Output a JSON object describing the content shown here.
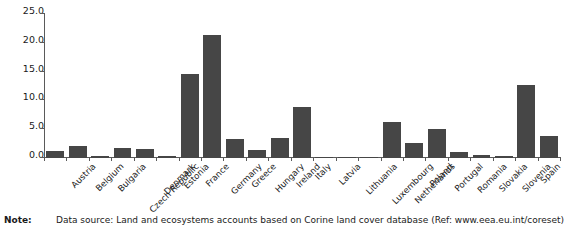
{
  "chart_data": {
    "type": "bar",
    "title": "",
    "subtitle": "",
    "xlabel": "",
    "ylabel": "",
    "ylim": [
      0.0,
      25.0
    ],
    "yticks": [
      "0.0",
      "5.0",
      "10.0",
      "15.0",
      "20.0",
      "25.0"
    ],
    "ytick_values": [
      0.0,
      5.0,
      10.0,
      15.0,
      20.0,
      25.0
    ],
    "grid": false,
    "legend": false,
    "legend_position": "none",
    "bar_color": "#464646",
    "axis_color": "#5a5a5a",
    "categories": [
      "Austria",
      "Belgium",
      "Bulgaria",
      "Czech Republic",
      "Denmark",
      "Estonia",
      "France",
      "Germany",
      "Greece",
      "Hungary",
      "Ireland",
      "Italy",
      "Latvia",
      "Lithuania",
      "Luxembourg",
      "Netherlands",
      "Poland",
      "Portugal",
      "Romania",
      "Slovakia",
      "Slovenia",
      "Spain",
      "United Kingdom"
    ],
    "values": [
      1.2,
      2.1,
      0.4,
      1.7,
      1.5,
      0.4,
      14.5,
      21.4,
      3.3,
      1.4,
      3.4,
      8.8,
      0.05,
      0.1,
      0.15,
      6.2,
      2.6,
      5.0,
      1.0,
      0.5,
      0.3,
      12.7,
      3.9
    ]
  },
  "note": {
    "label": "Note:",
    "text": "Data source: Land and ecosystems accounts based on Corine land cover database (Ref: www.eea.eu.int/coreset)"
  }
}
